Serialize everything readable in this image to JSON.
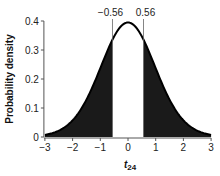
{
  "chart_data": {
    "type": "area",
    "title": "",
    "distribution": "Student t, 24 degrees of freedom",
    "df": 24,
    "xlabel": "t",
    "xlabel_subscript": "24",
    "ylabel": "Probability density",
    "xlim": [
      -3,
      3
    ],
    "ylim": [
      0,
      0.4
    ],
    "x_ticks": [
      -3,
      -2,
      -1,
      0,
      1,
      2,
      3
    ],
    "x_tick_labels": [
      "−3",
      "−2",
      "−1",
      "0",
      "1",
      "2",
      "3"
    ],
    "y_ticks": [
      0,
      0.1,
      0.2,
      0.3,
      0.4
    ],
    "y_tick_labels": [
      "0",
      "0.1",
      "0.2",
      "0.3",
      "0.4"
    ],
    "grid": false,
    "legend": null,
    "annotations": [
      {
        "x": -0.56,
        "label": "−0.56",
        "type": "vertical-line"
      },
      {
        "x": 0.56,
        "label": "0.56",
        "type": "vertical-line"
      }
    ],
    "shaded_regions": [
      {
        "from": -3,
        "to": -0.56,
        "fill": "#1a1a1a",
        "label": "left tail"
      },
      {
        "from": 0.56,
        "to": 3,
        "fill": "#1a1a1a",
        "label": "right tail"
      }
    ],
    "unshaded_region": {
      "from": -0.56,
      "to": 0.56
    },
    "x": [
      -3,
      -2.5,
      -2,
      -1.5,
      -1,
      -0.56,
      -0.5,
      0,
      0.5,
      0.56,
      1,
      1.5,
      2,
      2.5,
      3
    ],
    "values": [
      0.0066,
      0.0198,
      0.0537,
      0.1266,
      0.2371,
      0.3319,
      0.3423,
      0.394,
      0.3423,
      0.3319,
      0.2371,
      0.1266,
      0.0537,
      0.0198,
      0.0066
    ]
  },
  "colors": {
    "fill": "#1a1a1a",
    "curve": "#000000",
    "axis": "#555555",
    "background": "#ffffff"
  }
}
